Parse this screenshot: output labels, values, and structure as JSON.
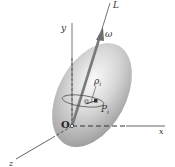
{
  "figure": {
    "labels": {
      "y_axis": "y",
      "x_axis": "x",
      "z_axis": "z",
      "origin": "O",
      "rotation_axis": "L",
      "angular_velocity": "ω",
      "rho": "ρ",
      "rho_sub": "i",
      "point": "P",
      "point_sub": "i"
    },
    "colors": {
      "body_light": "#f4f4f4",
      "body_mid": "#bdbdbd",
      "body_dark": "#8a8a8a",
      "axis_line": "#555555",
      "arrow": "#7a7a7a",
      "label": "#333333"
    }
  }
}
